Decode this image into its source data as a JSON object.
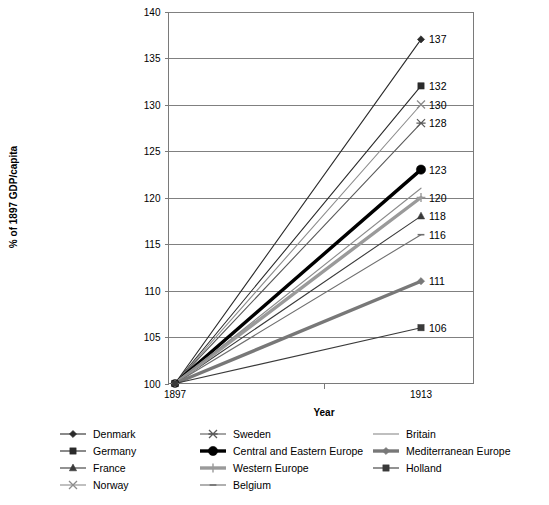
{
  "chart_data": {
    "type": "line",
    "title": "",
    "xlabel": "Year",
    "ylabel": "% of 1897 GDP/capita",
    "x": [
      1897,
      1913
    ],
    "categories": [
      "1897",
      "1913"
    ],
    "xtick_labels": [
      "1897",
      "1913"
    ],
    "ylim": [
      100,
      140
    ],
    "ytick_labels": [
      "100",
      "105",
      "110",
      "115",
      "120",
      "125",
      "130",
      "135",
      "140"
    ],
    "yticks": [
      100,
      105,
      110,
      115,
      120,
      125,
      130,
      135,
      140
    ],
    "grid": true,
    "legend_position": "bottom",
    "legend_columns": 3,
    "series": [
      {
        "name": "Denmark",
        "values": [
          100,
          137
        ],
        "end_label": "137",
        "marker": "diamond",
        "color": "#2b2b2b",
        "width": 1.1,
        "legend_col": 0,
        "legend_row": 0
      },
      {
        "name": "Germany",
        "values": [
          100,
          132
        ],
        "end_label": "132",
        "marker": "square",
        "color": "#2b2b2b",
        "width": 1.1,
        "legend_col": 0,
        "legend_row": 1
      },
      {
        "name": "France",
        "values": [
          100,
          118
        ],
        "end_label": "118",
        "marker": "triangle",
        "color": "#3a3a3a",
        "width": 1.1,
        "legend_col": 0,
        "legend_row": 2
      },
      {
        "name": "Norway",
        "values": [
          100,
          130
        ],
        "end_label": "130",
        "marker": "x",
        "color": "#8c8c8c",
        "width": 1.1,
        "legend_col": 0,
        "legend_row": 3
      },
      {
        "name": "Sweden",
        "values": [
          100,
          128
        ],
        "end_label": "128",
        "marker": "asterisk",
        "color": "#5a5a5a",
        "width": 1.1,
        "legend_col": 1,
        "legend_row": 0
      },
      {
        "name": "Central and Eastern Europe",
        "values": [
          100,
          123
        ],
        "end_label": "123",
        "marker": "circle",
        "color": "#000000",
        "width": 3.4,
        "legend_col": 1,
        "legend_row": 1
      },
      {
        "name": "Western Europe",
        "values": [
          100,
          120
        ],
        "end_label": "120",
        "marker": "plus",
        "color": "#9a9a9a",
        "width": 3.4,
        "legend_col": 1,
        "legend_row": 2
      },
      {
        "name": "Belgium",
        "values": [
          100,
          116
        ],
        "end_label": "116",
        "marker": "dash",
        "color": "#6f6f6f",
        "width": 1.1,
        "legend_col": 1,
        "legend_row": 3
      },
      {
        "name": "Britain",
        "values": [
          100,
          121
        ],
        "end_label": "",
        "marker": "none",
        "color": "#8a8a8a",
        "width": 1.1,
        "legend_col": 2,
        "legend_row": 0
      },
      {
        "name": "Mediterranean Europe",
        "values": [
          100,
          111
        ],
        "end_label": "111",
        "marker": "diamond",
        "color": "#787878",
        "width": 3.4,
        "legend_col": 2,
        "legend_row": 1
      },
      {
        "name": "Holland",
        "values": [
          100,
          106
        ],
        "end_label": "106",
        "marker": "square",
        "color": "#3a3a3a",
        "width": 1.1,
        "legend_col": 2,
        "legend_row": 2
      }
    ]
  },
  "axes": {
    "x_title": "Year",
    "y_title": "% of 1897 GDP/capita"
  },
  "legend": {
    "columns": [
      {
        "items": [
          "Denmark",
          "Germany",
          "France",
          "Norway"
        ]
      },
      {
        "items": [
          "Sweden",
          "Central and Eastern Europe",
          "Western Europe",
          "Belgium"
        ]
      },
      {
        "items": [
          "Britain",
          "Mediterranean Europe",
          "Holland"
        ]
      }
    ]
  },
  "colors": {
    "gridline": "#808080",
    "axis": "#7a7a7a",
    "text": "#000000",
    "background": "#ffffff"
  }
}
